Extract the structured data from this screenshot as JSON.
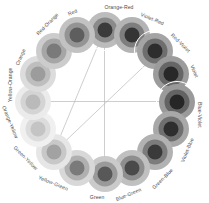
{
  "figure": {
    "background": "#ffffff",
    "center_x": 104.5,
    "center_y": 101.5,
    "swatch_radius": 72,
    "label_radius": 95,
    "segment_count": 16
  },
  "chart_data": {
    "type": "pie",
    "xlabel": "",
    "ylabel": "",
    "legend_position": "around-perimeter",
    "grid": false,
    "categories": [
      "Orange-Red",
      "Violet-Red",
      "Red-Violet",
      "Violet",
      "Blue-Violet",
      "Violet-Blue",
      "Green-Blue",
      "Blue-Green",
      "Green",
      "Yellow-Green",
      "Green-Yellow",
      "Orange-Yellow",
      "Yellow-Orange",
      "Orange",
      "Red-Orange",
      "Red"
    ],
    "values": [
      6.25,
      6.25,
      6.25,
      6.25,
      6.25,
      6.25,
      6.25,
      6.25,
      6.25,
      6.25,
      6.25,
      6.25,
      6.25,
      6.25,
      6.25,
      6.25
    ],
    "angles_deg": [
      0,
      22.5,
      45,
      67.5,
      90,
      112.5,
      135,
      157.5,
      180,
      202.5,
      225,
      247.5,
      270,
      292.5,
      315,
      337.5
    ],
    "series": [
      {
        "name": "outer-ring-tone",
        "values": [
          "#bcbcbc",
          "#b4b4b4",
          "#a4a4a4",
          "#9c9c9c",
          "#9a9a9a",
          "#a8a8a8",
          "#b2b2b2",
          "#c0c0c0",
          "#cacaca",
          "#d8d8d8",
          "#e6e6e6",
          "#f0f0f0",
          "#ebebeb",
          "#dcdcdc",
          "#cccccc",
          "#c2c2c2"
        ]
      },
      {
        "name": "mid-ring-tone",
        "values": [
          "#8a8a8a",
          "#7e7e7e",
          "#6e6e6e",
          "#666666",
          "#636363",
          "#6f6f6f",
          "#7c7c7c",
          "#8e8e8e",
          "#9a9a9a",
          "#b0b0b0",
          "#c8c8c8",
          "#dcdcdc",
          "#d4d4d4",
          "#bebebe",
          "#a6a6a6",
          "#949494"
        ]
      },
      {
        "name": "core-tone",
        "values": [
          "#3b3b3b",
          "#343434",
          "#2d2d2d",
          "#282828",
          "#262626",
          "#2e2e2e",
          "#3a3a3a",
          "#4a4a4a",
          "#585858",
          "#7a7a7a",
          "#a2a2a2",
          "#c4c4c4",
          "#bababa",
          "#9c9c9c",
          "#7a7a7a",
          "#5e5e5e"
        ]
      }
    ],
    "highlighted": [
      "Blue-Violet",
      "Orange-Red",
      "Red-Violet"
    ],
    "annotations": [
      {
        "name": "harmony-line-1",
        "from": "Orange-Red",
        "to": "Green-Yellow"
      },
      {
        "name": "harmony-line-2",
        "from": "Blue-Violet",
        "to": "Orange-Yellow"
      },
      {
        "name": "harmony-line-3",
        "from": "Red-Violet",
        "to": "Green-Yellow"
      },
      {
        "name": "harmony-line-4",
        "from": "Orange-Red",
        "to": "Blue-Green"
      }
    ]
  },
  "labels": {
    "l0": "Orange-Red",
    "l1": "Violet-Red",
    "l2": "Red-Violet",
    "l3": "Violet",
    "l4": "Blue-Violet",
    "l5": "Violet-Blue",
    "l6": "Green-Blue",
    "l7": "Blue-Green",
    "l8": "Green",
    "l9": "Yellow-Green",
    "l10": "Green-Yellow",
    "l11": "Orange-Yellow",
    "l12": "Yellow-Orange",
    "l13": "Orange",
    "l14": "Red-Orange",
    "l15": "Red"
  }
}
